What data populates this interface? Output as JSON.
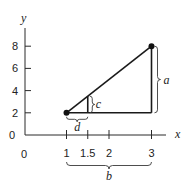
{
  "diagram": {
    "axes": {
      "x_label": "x",
      "y_label": "y",
      "origin_label": "0",
      "x_origin_label": "0",
      "x_ticks": [
        {
          "value": 1,
          "label": "1"
        },
        {
          "value": 1.5,
          "label": "1.5"
        },
        {
          "value": 2,
          "label": "2"
        },
        {
          "value": 3,
          "label": "3"
        }
      ],
      "y_ticks": [
        {
          "value": 2,
          "label": "2"
        },
        {
          "value": 4,
          "label": "4"
        },
        {
          "value": 6,
          "label": "6"
        },
        {
          "value": 8,
          "label": "8"
        }
      ],
      "x_range": [
        0,
        3.3
      ],
      "y_range": [
        0,
        9.5
      ]
    },
    "points": [
      {
        "name": "start",
        "x": 1,
        "y": 2
      },
      {
        "name": "end",
        "x": 3,
        "y": 8
      }
    ],
    "inner_vertical_x": 1.5,
    "labels": {
      "a": "a",
      "b": "b",
      "c": "c",
      "d": "d"
    },
    "colors": {
      "line": "#1a1a1a",
      "text": "#222222"
    }
  }
}
